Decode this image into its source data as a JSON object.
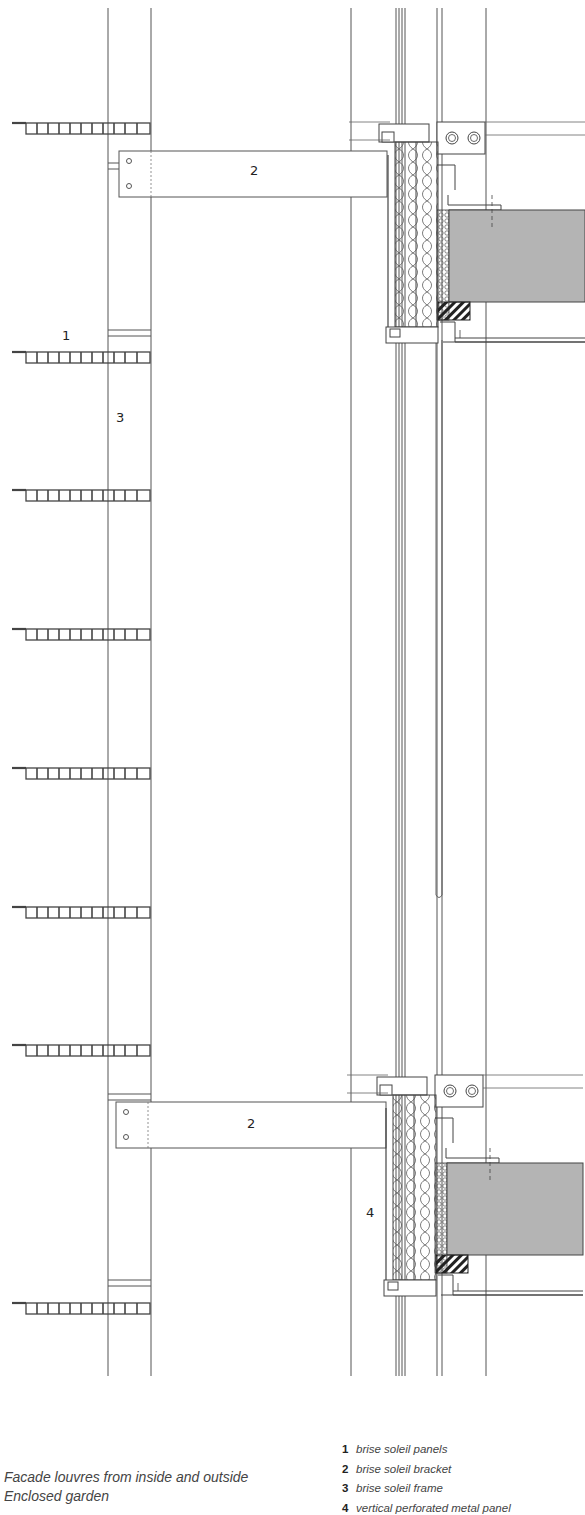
{
  "caption": {
    "line1": "Facade louvres from inside and outside",
    "line2": "Enclosed garden"
  },
  "legend": [
    {
      "num": "1",
      "text": "brise soleil panels"
    },
    {
      "num": "2",
      "text": "brise soleil bracket"
    },
    {
      "num": "3",
      "text": "brise soleil frame"
    },
    {
      "num": "4",
      "text": "vertical perforated metal panel"
    }
  ],
  "callouts": {
    "bracket_top": "2",
    "panels": "1",
    "frame": "3",
    "bracket_bottom": "2",
    "perforated_panel": "4"
  },
  "colors": {
    "line": "#555555",
    "slab": "#b4b4b4",
    "background": "#ffffff"
  },
  "louvre_rows_y": [
    128,
    357,
    496,
    635,
    773,
    912,
    1051,
    1307
  ]
}
